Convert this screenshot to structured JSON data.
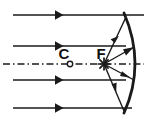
{
  "figure": {
    "kind": "optics-ray-diagram",
    "width": 147,
    "height": 126,
    "background_color": "#ffffff",
    "ink_color": "#1a1a1a"
  },
  "labels": {
    "center_of_curvature": "C",
    "focal_point": "F"
  },
  "markers": {
    "center_of_curvature": {
      "glyph": "open-circle",
      "x": 70,
      "y": 64,
      "radius": 2.6
    },
    "focal_point": {
      "glyph": "star-asterisk",
      "x": 104,
      "y": 64,
      "radius": 5.5,
      "spokes": 8
    }
  },
  "principal_axis": {
    "style": "dash-dot",
    "x1": 3,
    "x2": 144,
    "y": 64,
    "dash_pattern": "7 3 1.5 3"
  },
  "mirror": {
    "type": "concave",
    "description": "curved arc opening to the left",
    "top_x": 124,
    "top_y": 13,
    "bottom_x": 124,
    "bottom_y": 113,
    "vertex_x": 139,
    "vertex_y": 64,
    "stroke_width": 2.6
  },
  "incident_rays": [
    {
      "y": 15,
      "x_start": 144,
      "x_end": 12,
      "arrow_x": 62,
      "direction": "leftward"
    },
    {
      "y": 46,
      "x_start": 124,
      "x_end": 12,
      "arrow_x": 62,
      "direction": "leftward"
    },
    {
      "y": 80,
      "x_start": 124,
      "x_end": 12,
      "arrow_x": 62,
      "direction": "leftward"
    },
    {
      "y": 108,
      "x_start": 130,
      "x_end": 12,
      "arrow_x": 62,
      "direction": "leftward"
    }
  ],
  "reflected_rays": [
    {
      "from_x": 104,
      "from_y": 64,
      "to_x": 126,
      "to_y": 18,
      "arrow_at": 0.55,
      "note": "F to upper mirror edge"
    },
    {
      "from_x": 104,
      "from_y": 64,
      "to_x": 133,
      "to_y": 47,
      "arrow_at": 0.78,
      "note": "F to upper-mid mirror"
    },
    {
      "from_x": 104,
      "from_y": 64,
      "to_x": 133,
      "to_y": 79,
      "arrow_at": 0.6,
      "note": "F to lower-mid mirror"
    },
    {
      "from_x": 104,
      "from_y": 64,
      "to_x": 124,
      "to_y": 110,
      "arrow_at": 0.66,
      "note": "F to lower mirror edge"
    }
  ],
  "label_positions": {
    "C": {
      "x": 64,
      "y": 58
    },
    "F": {
      "x": 100,
      "y": 58
    }
  }
}
